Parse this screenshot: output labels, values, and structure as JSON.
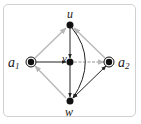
{
  "diagram": {
    "type": "directed-graph",
    "colors": {
      "primary_edge": "#222222",
      "secondary_edge": "#b8b8b8",
      "node": "#111111",
      "frame_border": "#d0d0d0"
    },
    "nodes": [
      {
        "id": "u",
        "label": "u",
        "x": 70,
        "y": 25,
        "style": "filled"
      },
      {
        "id": "v",
        "label": "v",
        "x": 70,
        "y": 62,
        "style": "filled"
      },
      {
        "id": "w",
        "label": "w",
        "x": 70,
        "y": 101,
        "style": "filled"
      },
      {
        "id": "a1",
        "label": "a",
        "sub": "1",
        "x": 31,
        "y": 62,
        "style": "double-circle"
      },
      {
        "id": "a2",
        "label": "a",
        "sub": "2",
        "x": 109,
        "y": 62,
        "style": "double-circle"
      }
    ],
    "edges": [
      {
        "from": "a1",
        "to": "u",
        "color": "gray"
      },
      {
        "from": "a2",
        "to": "u",
        "color": "gray"
      },
      {
        "from": "u",
        "to": "v",
        "color": "black"
      },
      {
        "from": "a1",
        "to": "v",
        "color": "black"
      },
      {
        "from": "v",
        "to": "a2",
        "color": "gray"
      },
      {
        "from": "v",
        "to": "w",
        "color": "black"
      },
      {
        "from": "u",
        "to": "w",
        "color": "black",
        "curved": true
      },
      {
        "from": "w",
        "to": "a1",
        "color": "gray"
      },
      {
        "from": "w",
        "to": "a2",
        "color": "black",
        "bidirectional": true
      }
    ]
  }
}
